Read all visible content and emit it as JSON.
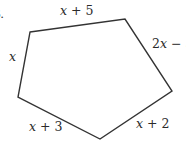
{
  "figure": {
    "item_number": "6.",
    "shape": "pentagon",
    "stroke_color": "#333333",
    "vertices": [
      {
        "x": 30,
        "y": 32
      },
      {
        "x": 125,
        "y": 19
      },
      {
        "x": 172,
        "y": 91
      },
      {
        "x": 100,
        "y": 139
      },
      {
        "x": 18,
        "y": 97
      }
    ],
    "side_labels": {
      "top": "x + 5",
      "top_right": "2x − 3",
      "bottom_right": "x + 2",
      "bottom_left": "x + 3",
      "left": "x"
    }
  }
}
